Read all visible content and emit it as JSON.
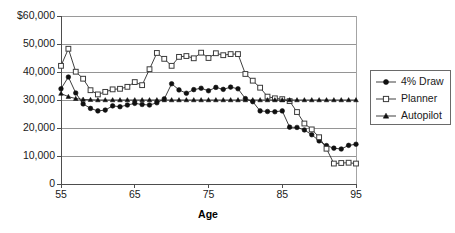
{
  "chart_data": {
    "type": "line",
    "title": "",
    "xlabel": "Age",
    "ylabel": "",
    "xlim": [
      55,
      95
    ],
    "ylim": [
      0,
      60000
    ],
    "grid": true,
    "legend_position": "right",
    "x_ticks": [
      "55",
      "65",
      "75",
      "85",
      "95"
    ],
    "x_tick_values": [
      55,
      65,
      75,
      85,
      95
    ],
    "y_ticks": [
      "0",
      "10,000",
      "20,000",
      "30,000",
      "40,000",
      "50,000",
      "$60,000"
    ],
    "y_tick_values": [
      0,
      10000,
      20000,
      30000,
      40000,
      50000,
      60000
    ],
    "x": [
      55,
      56,
      57,
      58,
      59,
      60,
      61,
      62,
      63,
      64,
      65,
      66,
      67,
      68,
      69,
      70,
      71,
      72,
      73,
      74,
      75,
      76,
      77,
      78,
      79,
      80,
      81,
      82,
      83,
      84,
      85,
      86,
      87,
      88,
      89,
      90,
      91,
      92,
      93,
      94,
      95
    ],
    "series": [
      {
        "name": "4% Draw",
        "marker": "circle",
        "color": "#101010",
        "values": [
          34000,
          38200,
          32500,
          28600,
          27000,
          26100,
          26400,
          27900,
          27600,
          28200,
          28800,
          28400,
          28200,
          29000,
          30400,
          35800,
          33600,
          32400,
          33700,
          34200,
          33300,
          34500,
          33800,
          34600,
          34000,
          30500,
          29400,
          26100,
          25900,
          25800,
          26100,
          20300,
          20200,
          19300,
          17600,
          15400,
          13700,
          12800,
          12500,
          13800,
          14200
        ]
      },
      {
        "name": "Planner",
        "marker": "square",
        "color": "#ffffff",
        "values": [
          42200,
          48300,
          40100,
          37600,
          33500,
          32000,
          32900,
          33800,
          34000,
          34700,
          36400,
          35300,
          41000,
          46800,
          44700,
          42200,
          45400,
          45700,
          44900,
          46900,
          45000,
          46700,
          46000,
          46400,
          46400,
          39300,
          36900,
          34400,
          31200,
          30600,
          30300,
          29600,
          25700,
          21600,
          19500,
          16700,
          12600,
          7300,
          7500,
          7600,
          7300
        ]
      },
      {
        "name": "Autopilot",
        "marker": "triangle",
        "color": "#101010",
        "values": [
          32300,
          31200,
          30500,
          30200,
          30100,
          30000,
          30000,
          30000,
          30000,
          30000,
          30000,
          30000,
          30000,
          30000,
          30000,
          30000,
          30000,
          30000,
          30000,
          30000,
          30000,
          30000,
          30000,
          30000,
          30000,
          30000,
          30000,
          30000,
          30000,
          30000,
          30000,
          30000,
          30000,
          30000,
          30000,
          30000,
          30000,
          30000,
          30000,
          30000,
          30000
        ]
      }
    ]
  },
  "legend": {
    "items": [
      {
        "label": "4% Draw",
        "marker": "circle"
      },
      {
        "label": "Planner",
        "marker": "square"
      },
      {
        "label": "Autopilot",
        "marker": "triangle"
      }
    ]
  }
}
